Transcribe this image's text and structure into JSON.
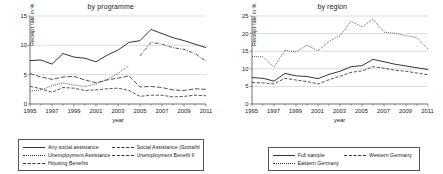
{
  "figure": {
    "panels": [
      {
        "title": "by programme",
        "xlabel": "year",
        "ylabel": "Receipt rate in %",
        "yticks": [
          "0",
          "5",
          "10",
          "15"
        ],
        "xticks": [
          "1995",
          "1997",
          "1999",
          "2001",
          "2003",
          "2005",
          "2007",
          "2009",
          "2011"
        ],
        "legend": [
          {
            "label": "Any social assistance",
            "style": "solid"
          },
          {
            "label": "Social Assistance (Sozialhilfe)",
            "style": "dashed"
          },
          {
            "label": "Unemployment Assistance",
            "style": "dotted"
          },
          {
            "label": "Unemployment Benefit II",
            "style": "dashdot"
          },
          {
            "label": "Housing Benefits",
            "style": "longdash"
          }
        ]
      },
      {
        "title": "by region",
        "xlabel": "year",
        "ylabel": "Receipt rate in %",
        "yticks": [
          "0",
          "5",
          "10",
          "15",
          "20",
          "25"
        ],
        "xticks": [
          "1995",
          "1997",
          "1999",
          "2001",
          "2003",
          "2005",
          "2007",
          "2009",
          "2011"
        ],
        "legend": [
          {
            "label": "Full sample",
            "style": "solid"
          },
          {
            "label": "Western Germany",
            "style": "dashed"
          },
          {
            "label": "Eastern Germany",
            "style": "dotted"
          }
        ]
      }
    ]
  },
  "chart_data": [
    {
      "type": "line",
      "title": "by programme",
      "xlabel": "year",
      "ylabel": "Receipt rate in %",
      "xlim": [
        1995,
        2011
      ],
      "ylim": [
        0,
        15
      ],
      "yticks": [
        0,
        5,
        10,
        15
      ],
      "xticks": [
        1995,
        1997,
        1999,
        2001,
        2003,
        2005,
        2007,
        2009,
        2011
      ],
      "grid": true,
      "legend_position": "below",
      "x": [
        1995,
        1996,
        1997,
        1998,
        1999,
        2000,
        2001,
        2002,
        2003,
        2004,
        2005,
        2006,
        2007,
        2008,
        2009,
        2010,
        2011
      ],
      "series": [
        {
          "name": "Any social assistance",
          "style": "solid",
          "values": [
            7.4,
            7.5,
            6.8,
            8.6,
            8.0,
            7.8,
            7.2,
            8.3,
            9.2,
            10.5,
            10.8,
            12.7,
            12.0,
            11.3,
            10.8,
            10.2,
            9.6
          ]
        },
        {
          "name": "Social Assistance (Sozialhilfe)",
          "style": "dashed",
          "values": [
            3.0,
            2.6,
            2.0,
            2.8,
            2.7,
            2.3,
            2.4,
            2.6,
            2.7,
            2.3,
            1.3,
            1.5,
            1.5,
            1.2,
            1.3,
            1.5,
            1.4
          ]
        },
        {
          "name": "Unemployment Assistance",
          "style": "dotted",
          "values": [
            2.2,
            2.4,
            3.1,
            3.6,
            3.2,
            3.0,
            3.4,
            4.2,
            5.2,
            6.6,
            null,
            null,
            null,
            null,
            null,
            null,
            null
          ]
        },
        {
          "name": "Unemployment Benefit II",
          "style": "dashdot",
          "values": [
            null,
            null,
            null,
            null,
            null,
            null,
            null,
            null,
            null,
            null,
            8.2,
            10.5,
            10.2,
            9.6,
            9.3,
            8.6,
            7.3
          ]
        },
        {
          "name": "Housing Benefits",
          "style": "longdash",
          "values": [
            5.2,
            4.6,
            4.2,
            4.6,
            4.7,
            4.1,
            3.6,
            4.1,
            4.4,
            4.8,
            2.9,
            3.0,
            2.8,
            2.4,
            2.3,
            2.6,
            2.5
          ]
        }
      ]
    },
    {
      "type": "line",
      "title": "by region",
      "xlabel": "year",
      "ylabel": "Receipt rate in %",
      "xlim": [
        1995,
        2011
      ],
      "ylim": [
        0,
        25
      ],
      "yticks": [
        0,
        5,
        10,
        15,
        20,
        25
      ],
      "xticks": [
        1995,
        1997,
        1999,
        2001,
        2003,
        2005,
        2007,
        2009,
        2011
      ],
      "grid": true,
      "legend_position": "below",
      "x": [
        1995,
        1996,
        1997,
        1998,
        1999,
        2000,
        2001,
        2002,
        2003,
        2004,
        2005,
        2006,
        2007,
        2008,
        2009,
        2010,
        2011
      ],
      "series": [
        {
          "name": "Full sample",
          "style": "solid",
          "values": [
            7.5,
            7.3,
            6.5,
            8.7,
            8.0,
            7.8,
            7.2,
            8.4,
            9.3,
            10.6,
            10.9,
            12.7,
            12.0,
            11.3,
            10.8,
            10.3,
            9.8
          ]
        },
        {
          "name": "Western Germany",
          "style": "dashed",
          "values": [
            6.1,
            6.0,
            5.7,
            7.3,
            6.8,
            6.4,
            5.7,
            6.9,
            7.9,
            9.0,
            9.4,
            10.6,
            10.2,
            9.6,
            9.3,
            8.8,
            8.3
          ]
        },
        {
          "name": "Eastern Germany",
          "style": "dotted",
          "values": [
            13.5,
            13.4,
            10.5,
            15.2,
            14.8,
            16.7,
            15.1,
            17.8,
            19.4,
            23.5,
            21.9,
            24.1,
            20.4,
            20.1,
            19.4,
            18.8,
            15.6
          ]
        }
      ]
    }
  ]
}
